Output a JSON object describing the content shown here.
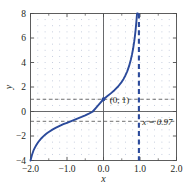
{
  "chart_data": {
    "type": "line",
    "title": "",
    "subtitle": "",
    "xlabel": "x",
    "ylabel": "y",
    "xlim": [
      -2.0,
      2.0
    ],
    "ylim": [
      -4,
      8
    ],
    "grid": "dotted",
    "legend": "none",
    "x_ticks": [
      -2.0,
      -1.0,
      0.0,
      1.0,
      2.0
    ],
    "x_tick_labels": [
      "−2.0",
      "−1.0",
      "0.0",
      "1.0",
      "2.0"
    ],
    "x_minor_ticks": [
      -1.5,
      -0.5,
      0.5,
      1.5
    ],
    "y_ticks": [
      -4,
      -2,
      0,
      2,
      4,
      6,
      8
    ],
    "y_tick_labels": [
      "−4",
      "−2",
      "0",
      "2",
      "4",
      "6",
      "8"
    ],
    "series": [
      {
        "name": "curve",
        "color": "#2b4a9b",
        "style": "solid",
        "points_x": [
          -2.0,
          -1.96,
          -1.92,
          -1.88,
          -1.84,
          -1.8,
          -1.75,
          -1.7,
          -1.65,
          -1.6,
          -1.55,
          -1.5,
          -1.4,
          -1.3,
          -1.2,
          -1.1,
          -1.0,
          -0.9,
          -0.8,
          -0.7,
          -0.6,
          -0.5,
          -0.4,
          -0.3,
          -0.2,
          -0.1,
          0.0,
          0.1,
          0.2,
          0.3,
          0.4,
          0.5,
          0.55,
          0.6,
          0.65,
          0.7,
          0.75,
          0.78,
          0.81,
          0.84,
          0.86,
          0.88,
          0.9,
          0.91,
          0.92,
          0.925,
          0.93,
          0.935,
          0.94
        ],
        "points_y": [
          -4.0,
          -3.55,
          -3.2,
          -2.95,
          -2.74,
          -2.55,
          -2.35,
          -2.18,
          -2.03,
          -1.9,
          -1.78,
          -1.67,
          -1.48,
          -1.32,
          -1.17,
          -1.04,
          -0.92,
          -0.8,
          -0.68,
          -0.56,
          -0.44,
          -0.31,
          -0.17,
          -0.02,
          0.32,
          0.66,
          1.0,
          1.24,
          1.48,
          1.74,
          2.04,
          2.42,
          2.66,
          2.94,
          3.28,
          3.7,
          4.24,
          4.64,
          5.1,
          5.68,
          6.14,
          6.66,
          7.3,
          7.66,
          8.0,
          8.0,
          8.0,
          8.0,
          8.0
        ]
      }
    ],
    "asymptote": {
      "kind": "vertical",
      "x": 0.97,
      "label": "x = 0.97",
      "style": "dashed",
      "color": "#2b4a9b"
    },
    "marked_point": {
      "x": 0,
      "y": 1,
      "label": "(0, 1)",
      "color": "#2b4a9b"
    },
    "guide_lines": [
      {
        "kind": "horizontal",
        "y": 1,
        "style": "dashed",
        "color": "#4d4d4d"
      },
      {
        "kind": "horizontal",
        "y": -0.8,
        "style": "dashed",
        "color": "#4d4d4d"
      }
    ],
    "annotations": [
      {
        "text": "(0, 1)",
        "x": 0.1,
        "y": 1.0
      },
      {
        "text": "x = 0.97",
        "x": 1.02,
        "y": -0.85
      }
    ],
    "colors": {
      "curve": "#2b4a9b",
      "asymptote": "#2b4a9b",
      "axis": "#58595b",
      "frame": "#4d4d4d",
      "grid_dot": "#9aa7c4",
      "guide": "#6d6e71",
      "text": "#231f20",
      "background": "#ffffff"
    }
  }
}
